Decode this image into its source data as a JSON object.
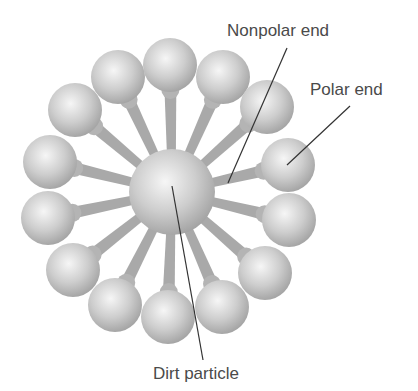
{
  "colors": {
    "background": "#ffffff",
    "sphere_light": "#f4f4f4",
    "sphere_mid": "#c8c8c8",
    "sphere_dark": "#9a9a9a",
    "tail": "#a8a8a8",
    "leader_line": "#333333",
    "label_text": "#4a4a4a"
  },
  "center_particle": {
    "cx": 172,
    "cy": 192,
    "r": 43
  },
  "head_radius": 27,
  "polar_heads": [
    {
      "cx": 118,
      "cy": 77
    },
    {
      "cx": 170,
      "cy": 65
    },
    {
      "cx": 223,
      "cy": 77
    },
    {
      "cx": 267,
      "cy": 107
    },
    {
      "cx": 288,
      "cy": 165
    },
    {
      "cx": 289,
      "cy": 220
    },
    {
      "cx": 265,
      "cy": 273
    },
    {
      "cx": 222,
      "cy": 307
    },
    {
      "cx": 168,
      "cy": 317
    },
    {
      "cx": 115,
      "cy": 305
    },
    {
      "cx": 73,
      "cy": 270
    },
    {
      "cx": 48,
      "cy": 218
    },
    {
      "cx": 50,
      "cy": 162
    },
    {
      "cx": 75,
      "cy": 110
    }
  ],
  "labels": {
    "nonpolar_end": "Nonpolar end",
    "polar_end": "Polar end",
    "dirt_particle": "Dirt particle"
  },
  "leader_lines": {
    "nonpolar_end": {
      "x1": 287,
      "y1": 48,
      "x2": 228,
      "y2": 183
    },
    "polar_end": {
      "x1": 350,
      "y1": 106,
      "x2": 287,
      "y2": 165
    },
    "dirt_particle": {
      "x1": 172,
      "y1": 186,
      "x2": 203,
      "y2": 360
    }
  }
}
